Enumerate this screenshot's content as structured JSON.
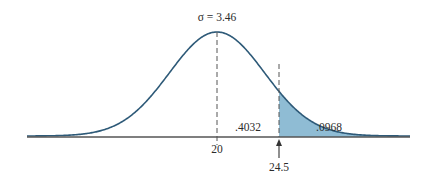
{
  "chart_data": {
    "type": "area",
    "title": "",
    "distribution": "normal",
    "mean": 20,
    "sigma": 3.46,
    "sigma_label": "σ = 3.46",
    "x_ticks": [
      {
        "value": 20,
        "label": "20"
      },
      {
        "value": 24.5,
        "label": "24.5",
        "arrow": true
      }
    ],
    "regions": [
      {
        "name": "between mean and 24.5",
        "from": 20,
        "to": 24.5,
        "area": 0.4032,
        "label": ".4032",
        "shaded": false
      },
      {
        "name": "right tail beyond 24.5",
        "from": 24.5,
        "to": null,
        "area": 0.0968,
        "label": ".0968",
        "shaded": true
      }
    ],
    "xlabel": "",
    "ylabel": "",
    "grid": false,
    "colors": {
      "curve": "#2e5a78",
      "fill": "#8fbcd4",
      "axis": "#555555",
      "dashed": "#555555"
    }
  }
}
